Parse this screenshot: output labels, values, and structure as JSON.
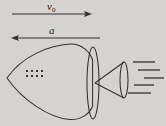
{
  "figure": {
    "background_color": "#d4d3cf",
    "stroke_color": "#332f2e",
    "annotations": {
      "velocity_symbol": "v",
      "velocity_subscript": "0",
      "acceleration_symbol": "a"
    },
    "arrows": [
      {
        "name": "velocity-arrow",
        "label": "v0",
        "direction": "right",
        "x1": 12,
        "y1": 14,
        "x2": 92,
        "y2": 14
      },
      {
        "name": "acceleration-arrow",
        "label": "a",
        "direction": "left",
        "x1": 100,
        "y1": 38,
        "x2": 11,
        "y2": 38
      }
    ],
    "body": {
      "name": "rocket-body",
      "nose_x": 7,
      "nose_y": 78,
      "base_center_x": 93,
      "base_center_y": 83,
      "base_rx": 6,
      "base_ry": 36
    },
    "nozzle": {
      "name": "rocket-nozzle",
      "apex_x": 95,
      "apex_y": 83,
      "mouth_center_x": 124,
      "mouth_center_y": 80,
      "mouth_rx": 4,
      "mouth_ry": 18
    },
    "payload_dots": {
      "name": "payload-dot-grid",
      "columns": 4,
      "rows": 2,
      "start_x": 26,
      "start_y": 70,
      "spacing_x": 5,
      "spacing_y": 5,
      "dot_size": 2
    },
    "exhaust_lines": [
      {
        "x1": 133,
        "y1": 62,
        "x2": 155,
        "y2": 62
      },
      {
        "x1": 138,
        "y1": 70,
        "x2": 160,
        "y2": 70
      },
      {
        "x1": 144,
        "y1": 78,
        "x2": 164,
        "y2": 78
      },
      {
        "x1": 134,
        "y1": 85,
        "x2": 154,
        "y2": 85
      },
      {
        "x1": 128,
        "y1": 93,
        "x2": 151,
        "y2": 93
      }
    ]
  }
}
